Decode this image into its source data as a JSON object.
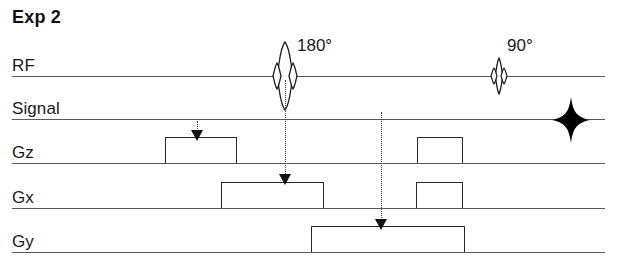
{
  "diagram": {
    "title": "Exp 2",
    "type": "mri-pulse-sequence-timing-diagram",
    "width": 617,
    "height": 278,
    "background_color": "#ffffff",
    "line_color": "#555a5e",
    "stroke_color": "#2b2b2b"
  },
  "rows": [
    {
      "id": "rf",
      "label": "RF",
      "baseline_y": 76,
      "label_y": 56
    },
    {
      "id": "signal",
      "label": "Signal",
      "baseline_y": 119,
      "label_y": 99
    },
    {
      "id": "gz",
      "label": "Gz",
      "baseline_y": 163,
      "label_y": 143
    },
    {
      "id": "gx",
      "label": "Gx",
      "baseline_y": 208,
      "label_y": 188
    },
    {
      "id": "gy",
      "label": "Gy",
      "baseline_y": 252,
      "label_y": 232
    }
  ],
  "rf_pulses": [
    {
      "id": "pulse-180",
      "label": "180°",
      "flip_angle_degrees": 180,
      "center_x": 285,
      "label_x": 297,
      "label_y": 36,
      "main_lobe_half_height": 34,
      "main_lobe_half_width": 5,
      "side_lobe_half_height": 13,
      "side_lobe_half_width": 4,
      "side_lobe_offset": 8
    },
    {
      "id": "pulse-90",
      "label": "90°",
      "flip_angle_degrees": 90,
      "center_x": 498,
      "label_x": 507,
      "label_y": 36,
      "main_lobe_half_height": 17,
      "main_lobe_half_width": 3,
      "side_lobe_half_height": 8,
      "side_lobe_half_width": 3,
      "side_lobe_offset": 5
    }
  ],
  "echo": {
    "id": "echo-signal",
    "row": "signal",
    "center_x": 570,
    "half_width": 18,
    "half_height": 22,
    "color": "#000000"
  },
  "gradient_pulses": [
    {
      "id": "gz-pulse-1",
      "row": "gz",
      "x_start": 165,
      "x_end": 237,
      "height": 26
    },
    {
      "id": "gz-pulse-2",
      "row": "gz",
      "x_start": 417,
      "x_end": 463,
      "height": 26
    },
    {
      "id": "gx-pulse-1",
      "row": "gx",
      "x_start": 221,
      "x_end": 324,
      "height": 26
    },
    {
      "id": "gx-pulse-2",
      "row": "gx",
      "x_start": 416,
      "x_end": 463,
      "height": 26
    },
    {
      "id": "gy-pulse-1",
      "row": "gy",
      "x_start": 311,
      "x_end": 465,
      "height": 26
    }
  ],
  "annotations": [
    {
      "id": "arrow-to-gz",
      "x": 197,
      "y_start": 124,
      "y_end": 141,
      "arrow_y": 130
    },
    {
      "id": "dotted-180-to-gx",
      "x": 285,
      "y_start": 80,
      "y_end": 186,
      "arrow_y": 175
    },
    {
      "id": "dotted-signal-to-gy",
      "x": 381,
      "y_start": 112,
      "y_end": 231,
      "arrow_y": 220
    }
  ],
  "baseline_extent": {
    "x_start": 12,
    "x_end": 605
  }
}
